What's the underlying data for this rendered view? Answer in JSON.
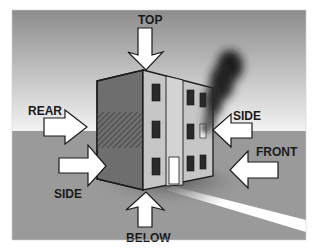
{
  "diagram": {
    "labels": {
      "top": "TOP",
      "rear": "REAR",
      "side_left": "SIDE",
      "side_right": "SIDE",
      "front": "FRONT",
      "below": "BELOW"
    },
    "elements": [
      "building",
      "smoke-plume",
      "fire-window",
      "ground",
      "sky",
      "road"
    ],
    "colors": {
      "sky_top": "#8c8c8c",
      "sky_bottom": "#f4f4f4",
      "ground": "#9a9a9a",
      "building_left_face": "#6e6e6e",
      "building_front_face": "#c6c6c6",
      "window": "#2a2a2a",
      "smoke": "#1e1e1e",
      "arrow_fill": "#ffffff",
      "outline": "#1a1a1a"
    }
  }
}
